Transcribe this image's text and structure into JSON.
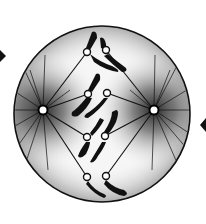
{
  "diagram": {
    "phase": "prometaphase",
    "canvas": {
      "width": 206,
      "height": 224,
      "background": "#ffffff"
    },
    "colors": {
      "ink": "#111111",
      "stipple": "#3a3a3a",
      "cell_fill": "#f4f4f4",
      "centromere_fill": "#ffffff"
    },
    "cell": {
      "cx": 102,
      "cy": 114,
      "r": 88
    },
    "poles": [
      {
        "name": "left-centrosome",
        "cx": 43,
        "cy": 110
      },
      {
        "name": "right-centrosome",
        "cx": 154,
        "cy": 110
      }
    ],
    "spindle": {
      "top": [
        98,
        52
      ],
      "bottom": [
        98,
        181
      ]
    },
    "chromosomes": [
      {
        "name": "chromosome-1",
        "centromeres": [
          [
            87,
            52
          ],
          [
            106,
            50
          ]
        ]
      },
      {
        "name": "chromosome-2",
        "centromeres": [
          [
            88,
            94
          ],
          [
            107,
            93
          ]
        ]
      },
      {
        "name": "chromosome-3",
        "centromeres": [
          [
            87,
            137
          ],
          [
            105,
            136
          ]
        ]
      },
      {
        "name": "chromosome-4",
        "centromeres": [
          [
            87,
            177
          ],
          [
            106,
            176
          ]
        ]
      }
    ],
    "arrows": [
      {
        "name": "left-arrowhead",
        "x": 3,
        "y": 55,
        "direction": "left"
      },
      {
        "name": "right-arrowhead",
        "x": 204,
        "y": 125,
        "direction": "right"
      }
    ]
  }
}
